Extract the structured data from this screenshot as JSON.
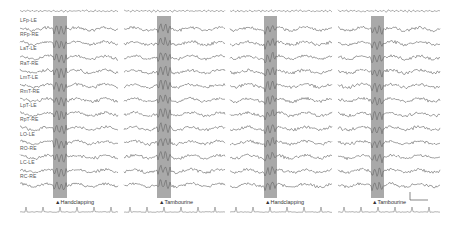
{
  "figure": {
    "type": "eeg-trace-panels",
    "channels": [
      "LFp-LE",
      "RFp-RE",
      "LaT-LE",
      "RaT-RE",
      "LmT-LE",
      "RmT-RE",
      "LpT-LE",
      "RpT-RE",
      "LO-LE",
      "RO-RE",
      "LC-LE",
      "RC-RE"
    ],
    "panels": [
      {
        "x0": 20,
        "x1": 118,
        "band_x": 53,
        "band_w": 14,
        "event": "▲Handclapping",
        "event_x": 55
      },
      {
        "x0": 124,
        "x1": 225,
        "band_x": 157,
        "band_w": 14,
        "event": "▲Tambourine",
        "event_x": 159
      },
      {
        "x0": 230,
        "x1": 332,
        "band_x": 264,
        "band_w": 13,
        "event": "▲Handclapping",
        "event_x": 265
      },
      {
        "x0": 338,
        "x1": 440,
        "band_x": 371,
        "band_w": 13,
        "event": "▲Tambourine",
        "event_x": 372
      }
    ],
    "colors": {
      "trace": "#666666",
      "band": "#a9a9a9",
      "text": "#444444"
    },
    "scale_bar": true
  }
}
